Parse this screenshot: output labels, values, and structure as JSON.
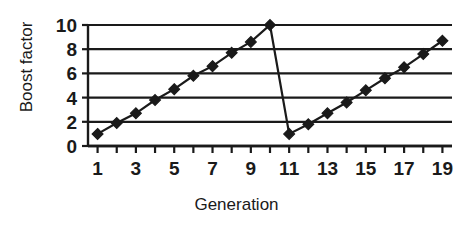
{
  "chart_data": {
    "type": "line",
    "title": "",
    "xlabel": "Generation",
    "ylabel": "Boost factor",
    "x": [
      1,
      2,
      3,
      4,
      5,
      6,
      7,
      8,
      9,
      10,
      11,
      12,
      13,
      14,
      15,
      16,
      17,
      18,
      19
    ],
    "values": [
      1.0,
      1.9,
      2.7,
      3.8,
      4.7,
      5.8,
      6.6,
      7.7,
      8.6,
      10.0,
      1.0,
      1.8,
      2.7,
      3.6,
      4.6,
      5.6,
      6.5,
      7.6,
      8.7
    ],
    "series": [
      {
        "name": "Boost factor",
        "values": [
          1.0,
          1.9,
          2.7,
          3.8,
          4.7,
          5.8,
          6.6,
          7.7,
          8.6,
          10.0,
          1.0,
          1.8,
          2.7,
          3.6,
          4.6,
          5.6,
          6.5,
          7.6,
          8.7
        ]
      }
    ],
    "xlim": [
      0.5,
      19.5
    ],
    "ylim": [
      0,
      10
    ],
    "x_tick_labels": [
      "1",
      "3",
      "5",
      "7",
      "9",
      "11",
      "13",
      "15",
      "17",
      "19"
    ],
    "x_tick_label_values": [
      1,
      3,
      5,
      7,
      9,
      11,
      13,
      15,
      17,
      19
    ],
    "x_minor_ticks": [
      1,
      2,
      3,
      4,
      5,
      6,
      7,
      8,
      9,
      10,
      11,
      12,
      13,
      14,
      15,
      16,
      17,
      18,
      19
    ],
    "y_tick_labels": [
      "0",
      "2",
      "4",
      "6",
      "8",
      "10"
    ],
    "y_tick_label_values": [
      0,
      2,
      4,
      6,
      8,
      10
    ],
    "grid": "horizontal",
    "legend": "none",
    "marker": "diamond",
    "line_color": "#1a1a1a",
    "marker_color": "#1a1a1a",
    "grid_color": "#1a1a1a",
    "background_color": "#ffffff"
  }
}
